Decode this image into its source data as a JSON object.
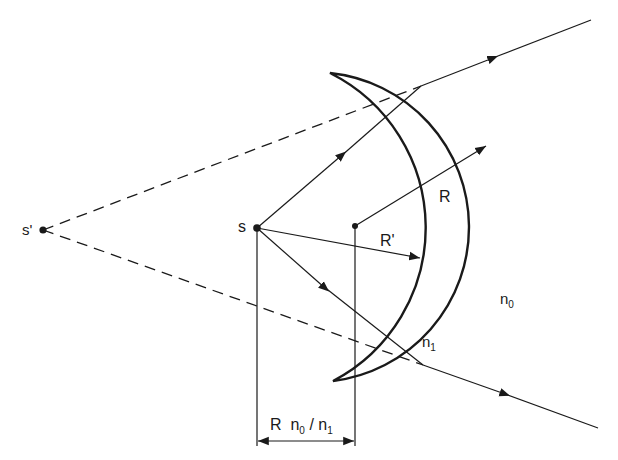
{
  "diagram": {
    "points": {
      "source": {
        "label": "s",
        "x": 257,
        "y": 228
      },
      "virtual_source": {
        "label": "s'",
        "x": 43,
        "y": 230
      },
      "outer_center": {
        "x": 355,
        "y": 226
      }
    },
    "labels": {
      "s": "s",
      "s_prime": "s'",
      "R": "R",
      "R_prime": "R'",
      "n0_base": "n",
      "n0_sub": "0",
      "n1_base": "n",
      "n1_sub": "1",
      "dimension_R": "R",
      "dimension_n0_base": "n",
      "dimension_n0_sub": "0",
      "dimension_slash": "/",
      "dimension_n1_base": "n",
      "dimension_n1_sub": "1"
    },
    "dimension": "R n0 / n1",
    "colors": {
      "ink": "#1a1a1a",
      "background": "#ffffff"
    }
  }
}
